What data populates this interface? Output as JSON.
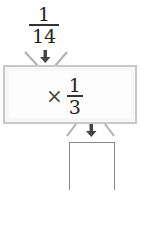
{
  "input": {
    "numerator": "1",
    "denominator": "14"
  },
  "operation": {
    "symbol": "×",
    "numerator": "1",
    "denominator": "3"
  },
  "output": {
    "value": ""
  },
  "colors": {
    "box_border": "#c8c8c8",
    "box_fill": "#f7f7f7",
    "arrow": "#444444",
    "funnel": "#b0b0b0"
  }
}
